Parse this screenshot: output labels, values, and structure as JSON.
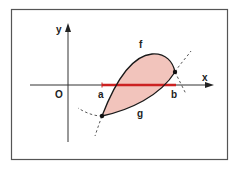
{
  "figure": {
    "labels": {
      "y_axis": "y",
      "x_axis": "x",
      "origin": "O",
      "a": "a",
      "b": "b",
      "f": "f",
      "g": "g"
    },
    "colors": {
      "frame": "#555555",
      "axis": "#333333",
      "curve": "#1a1a1a",
      "region_fill": "#f2c4bc",
      "interval": "#cc2222"
    }
  }
}
